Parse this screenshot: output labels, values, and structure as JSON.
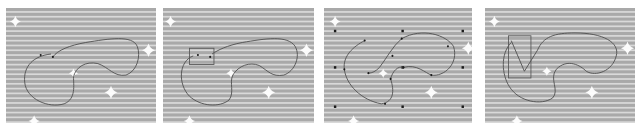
{
  "figure": {
    "colors": {
      "stripe_dark": "#a9a9a9",
      "stripe_light": "#d9d9d9",
      "curve": "#4a4a4a",
      "control_point": "#1a1a1a",
      "selection_box": "#555555",
      "sparkle": "#ffffff"
    },
    "panels": [
      {
        "id": 1,
        "label": "",
        "curve": "M 48 48 C 30 50, 18 60, 20 78 C 22 95, 45 105, 62 100 C 75 95, 72 80, 72 72 C 74 62, 85 55, 98 58 C 110 62, 115 72, 128 70 C 140 66, 144 50, 140 40 C 135 28, 110 32, 85 36 C 68 39, 55 44, 50 51",
        "points": [
          [
            37,
            49
          ],
          [
            50,
            51
          ]
        ],
        "sparkles": [
          [
            10,
            14,
            6
          ],
          [
            72,
            68,
            5
          ],
          [
            112,
            88,
            7
          ],
          [
            152,
            44,
            7
          ],
          [
            30,
            118,
            6
          ]
        ]
      },
      {
        "id": 2,
        "label": "",
        "curve": "M 32 50 C 16 56, 16 80, 28 92 C 40 103, 60 104, 70 96 C 76 88, 70 78, 74 70 C 80 60, 92 56, 102 60 C 112 66, 115 72, 128 70 C 140 66, 146 50, 140 40 C 132 28, 108 32, 84 36 C 68 39, 58 44, 52 48",
        "points": [
          [
            37,
            49
          ],
          [
            50,
            51
          ]
        ],
        "selection_box": [
          28,
          42,
          26,
          17
        ],
        "sparkles": [
          [
            8,
            14,
            6
          ],
          [
            72,
            68,
            5
          ],
          [
            112,
            88,
            7
          ],
          [
            152,
            44,
            7
          ],
          [
            28,
            118,
            6
          ]
        ]
      },
      {
        "id": 3,
        "label": "",
        "curve": "M 44 34 C 32 40, 20 50, 22 64 C 24 80, 40 96, 62 100 C 76 98, 76 86, 72 74 C 74 66, 80 60, 86 62 C 100 58, 110 68, 116 70 C 130 72, 146 58, 140 40 C 132 28, 106 20, 84 32 C 74 40, 68 52, 60 62 C 56 66, 52 68, 48 68",
        "points": [
          [
            44,
            34
          ],
          [
            22,
            64
          ],
          [
            66,
            100
          ],
          [
            72,
            74
          ],
          [
            86,
            62
          ],
          [
            116,
            70
          ],
          [
            84,
            32
          ],
          [
            48,
            68
          ],
          [
            134,
            40
          ],
          [
            74,
            50
          ]
        ],
        "grid_points": [
          [
            12,
            24
          ],
          [
            85,
            24
          ],
          [
            150,
            24
          ],
          [
            12,
            62
          ],
          [
            85,
            62
          ],
          [
            150,
            62
          ],
          [
            12,
            103
          ],
          [
            85,
            103
          ],
          [
            150,
            103
          ]
        ],
        "sparkles": [
          [
            12,
            14,
            6
          ],
          [
            64,
            68,
            5
          ],
          [
            116,
            88,
            7
          ],
          [
            156,
            42,
            7
          ],
          [
            32,
            118,
            6
          ]
        ]
      },
      {
        "id": 4,
        "label": "",
        "curve": "M 28 36 C 16 48, 18 70, 26 82 C 36 98, 60 102, 72 94 C 80 86, 68 74, 76 64 C 88 52, 102 60, 108 66 C 118 72, 136 66, 140 50 C 144 36, 126 26, 96 26 C 74 26, 62 30, 56 44",
        "zigzag": "M 28 34 L 42 66 L 56 44",
        "selection_box": [
          25,
          29,
          24,
          44
        ],
        "sparkles": [
          [
            10,
            14,
            6
          ],
          [
            66,
            66,
            5
          ],
          [
            114,
            88,
            7
          ],
          [
            152,
            42,
            7
          ],
          [
            34,
            118,
            6
          ]
        ]
      }
    ]
  }
}
